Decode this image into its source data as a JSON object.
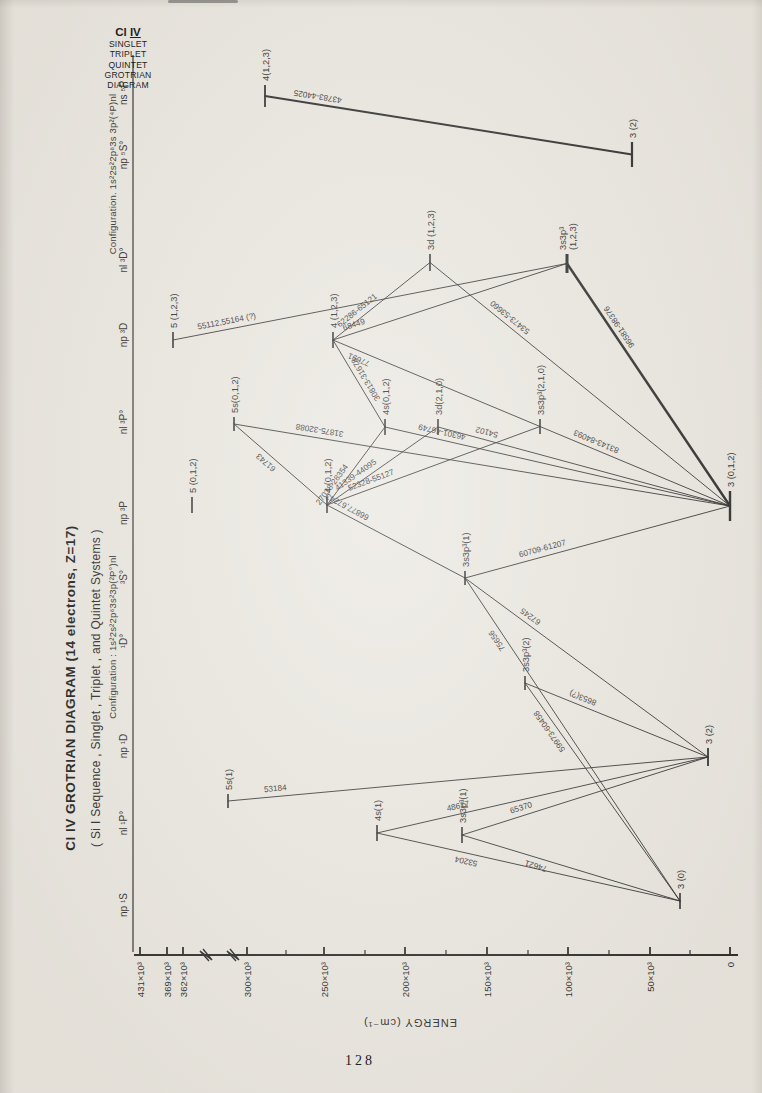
{
  "page": {
    "number": "128",
    "paper": "#ebe8e1",
    "ink": "#2b2b2b"
  },
  "corner_block": {
    "line1_prefix": "Cl ",
    "line1_numeral": "IV",
    "lines": [
      "SINGLET",
      "TRIPLET",
      "QUINTET",
      "GROTRIAN",
      "DIAGRAM"
    ]
  },
  "titles": {
    "main": "Cl IV  GROTRIAN  DIAGRAM  (14 electrons, Z=17)",
    "sub": "( Si I  Sequence ,  Singlet ,  Triplet ,  and  Quintet  Systems )"
  },
  "configurations": {
    "main": {
      "text": "Configuration : 1s²2s²2p⁶3s²3p(²P°)nl",
      "cx": 456,
      "y": 112
    },
    "quintet": {
      "text": "Configuration. 1s²2s²2p⁶3s 3p²(⁴P)nl",
      "cx": 919,
      "y": 112
    }
  },
  "axis": {
    "label": "ENERGY (cm⁻¹)",
    "label_x": 74,
    "label_y": 410,
    "x": 138,
    "y_top": 134,
    "y_bottom": 738,
    "ticks": [
      {
        "label": "431×10³",
        "y": 140
      },
      {
        "label": "369×10³",
        "y": 167
      },
      {
        "label": "362×10³",
        "y": 183
      },
      {
        "label": "300×10³",
        "y": 247
      },
      {
        "label": "250×10³",
        "y": 324
      },
      {
        "label": "200×10³",
        "y": 405
      },
      {
        "label": "150×10³",
        "y": 487
      },
      {
        "label": "100×10³",
        "y": 568
      },
      {
        "label": "50×10³",
        "y": 650
      },
      {
        "label": "0",
        "y": 730
      }
    ],
    "minor_ticks": [
      286,
      365,
      446,
      528,
      609,
      690
    ],
    "break_y": [
      203,
      230
    ]
  },
  "header_rule": {
    "y": 133,
    "x1": 141,
    "x2": 1038
  },
  "headers": [
    {
      "label": "np ¹S",
      "x": 188
    },
    {
      "label": "nl ¹P°",
      "x": 270
    },
    {
      "label": "np ¹D",
      "x": 347
    },
    {
      "label": "¹D°",
      "x": 452
    },
    {
      "label": "³S°",
      "x": 516
    },
    {
      "label": "np ³P",
      "x": 580
    },
    {
      "label": "nl ³P°",
      "x": 671
    },
    {
      "label": "np ³D",
      "x": 758
    },
    {
      "label": "nl ³D°",
      "x": 833
    },
    {
      "label": "np ⁵S°",
      "x": 938
    },
    {
      "label": "ns ⁵P",
      "x": 1000
    }
  ],
  "levels": [
    {
      "id": "s1",
      "label": "3 (0)",
      "x1": 184,
      "x2": 200,
      "y": 680,
      "lw": 1.6
    },
    {
      "id": "s2",
      "label": "5s(1)",
      "x1": 285,
      "x2": 299,
      "y": 228,
      "lw": 1.6
    },
    {
      "id": "s3",
      "label": "4s(1)",
      "x1": 252,
      "x2": 268,
      "y": 377,
      "lw": 1.6
    },
    {
      "id": "s4",
      "label": "3s3p³(1)",
      "x1": 250,
      "x2": 266,
      "y": 462,
      "lw": 1.6
    },
    {
      "id": "s5",
      "label": "3 (2)",
      "x1": 327,
      "x2": 345,
      "y": 708,
      "lw": 1.8
    },
    {
      "id": "s6",
      "label": "3s3p³(2)",
      "x1": 403,
      "x2": 417,
      "y": 525,
      "lw": 1.6
    },
    {
      "id": "s7",
      "label": "3s3p³(1)",
      "x1": 508,
      "x2": 522,
      "y": 465,
      "lw": 1.6
    },
    {
      "id": "t5p",
      "label": "5 (0,1,2)",
      "x1": 580,
      "x2": 596,
      "y": 192,
      "lw": 1.6
    },
    {
      "id": "t4p",
      "label": "4 (0,1,2)",
      "x1": 580,
      "x2": 596,
      "y": 327,
      "lw": 1.6
    },
    {
      "id": "g",
      "label": "3 (0,1,2)",
      "x1": 572,
      "x2": 602,
      "y": 730,
      "lw": 2.4
    },
    {
      "id": "t5s",
      "label": "5s(0,1,2)",
      "x1": 662,
      "x2": 676,
      "y": 234,
      "lw": 1.6
    },
    {
      "id": "t4s",
      "label": "4s(0,1,2)",
      "x1": 658,
      "x2": 674,
      "y": 385,
      "lw": 1.6
    },
    {
      "id": "t3d",
      "label": "3d(2,1,0)",
      "x1": 658,
      "x2": 674,
      "y": 438,
      "lw": 1.6
    },
    {
      "id": "t3p3P",
      "label": "3s3p³(2,1,0)",
      "x1": 659,
      "x2": 674,
      "y": 540,
      "lw": 1.6
    },
    {
      "id": "t5pD",
      "label": "5 (1,2,3)",
      "x1": 745,
      "x2": 761,
      "y": 173,
      "lw": 1.6
    },
    {
      "id": "t4pD",
      "label": "4 (1,2,3)",
      "x1": 745,
      "x2": 761,
      "y": 333,
      "lw": 1.6
    },
    {
      "id": "t3dD",
      "label": "3d (1,2,3)",
      "x1": 822,
      "x2": 839,
      "y": 430,
      "lw": 1.6
    },
    {
      "id": "t3p3D",
      "label": "3s3p³",
      "label2": "(1,2,3)",
      "x1": 820,
      "x2": 839,
      "y": 567,
      "lw": 3
    },
    {
      "id": "q3",
      "label": "3 (2)",
      "x1": 926,
      "x2": 951,
      "y": 632,
      "lw": 2.2
    },
    {
      "id": "q4",
      "label": "4(1,2,3)",
      "x1": 986,
      "x2": 1008,
      "y": 265,
      "lw": 1.8
    }
  ],
  "transitions": [
    {
      "from": "q4",
      "to": "q3",
      "label": "43783-44025",
      "t": 0.14,
      "side": 1,
      "w": 2.0
    },
    {
      "from": "t5pD",
      "to": "t3p3D",
      "label": "55112,55164 (?)",
      "t": 0.14,
      "side": 1,
      "w": 0.9
    },
    {
      "from": "t4pD",
      "to": "t3p3D",
      "label": "68449",
      "t": 0.1,
      "side": 1,
      "w": 0.9
    },
    {
      "from": "t4pD",
      "to": "t3dD",
      "label": "62286-65121",
      "t": 0.3,
      "side": 1,
      "w": 0.9
    },
    {
      "from": "t4pD",
      "to": "t3p3P",
      "label": "77691",
      "t": 0.14,
      "side": -1,
      "w": 0.9
    },
    {
      "from": "t4pD",
      "to": "t4s",
      "label": "30813-31678",
      "t": 0.5,
      "side": 1,
      "w": 0.9
    },
    {
      "from": "t5s",
      "to": "g",
      "label": "31875-32088",
      "t": 0.17,
      "side": 1,
      "w": 0.9
    },
    {
      "from": "t5s",
      "to": "t4p",
      "label": "61743",
      "t": 0.4,
      "side": -1,
      "w": 0.9
    },
    {
      "from": "t4p",
      "to": "t4s",
      "label": "27038-28354",
      "t": 0.2,
      "side": 1,
      "w": 0.9
    },
    {
      "from": "t4p",
      "to": "t3d",
      "label": "41339-44095",
      "t": 0.3,
      "side": 1,
      "w": 0.9
    },
    {
      "from": "t4p",
      "to": "t3p3P",
      "label": "52328-55127",
      "t": 0.22,
      "side": 1,
      "w": 0.9
    },
    {
      "from": "t4p",
      "to": "s7",
      "label": "66877,67243",
      "t": 0.12,
      "side": 1,
      "w": 0.9
    },
    {
      "from": "t3dD",
      "to": "g",
      "label": "53473-53660",
      "t": 0.25,
      "side": 1,
      "w": 0.9
    },
    {
      "from": "t3p3D",
      "to": "g",
      "label": "96581-98376",
      "t": 0.28,
      "side": 1,
      "w": 2.4
    },
    {
      "from": "t3p3P",
      "to": "g",
      "label": "83143-84093",
      "t": 0.28,
      "side": 1,
      "w": 0.9
    },
    {
      "from": "t3d",
      "to": "g",
      "label": "54102",
      "t": 0.16,
      "side": 1,
      "w": 0.9
    },
    {
      "from": "t4s",
      "to": "g",
      "label": "46301-46749",
      "t": 0.16,
      "side": 1,
      "w": 0.9
    },
    {
      "from": "s7",
      "to": "g",
      "label": "60709-61207",
      "t": 0.3,
      "side": 1,
      "w": 0.9
    },
    {
      "from": "s7",
      "to": "s5",
      "label": "67245",
      "t": 0.25,
      "side": 1,
      "w": 0.9
    },
    {
      "from": "s7",
      "to": "s1",
      "label": "75656",
      "t": 0.18,
      "side": -1,
      "w": 0.9
    },
    {
      "from": "s6",
      "to": "s5",
      "label": "8653(?)",
      "t": 0.3,
      "side": 1,
      "w": 0.9
    },
    {
      "from": "s6",
      "to": "s1",
      "label": "59973-60458",
      "t": 0.2,
      "side": -1,
      "w": 0.9
    },
    {
      "from": "s4",
      "to": "s5",
      "label": "65370",
      "t": 0.25,
      "side": 1,
      "w": 0.9
    },
    {
      "from": "s4",
      "to": "s1",
      "label": "74621",
      "t": 0.35,
      "side": -1,
      "w": 0.9
    },
    {
      "from": "s3",
      "to": "s5",
      "label": "48617",
      "t": 0.25,
      "side": 1,
      "w": 0.9
    },
    {
      "from": "s3",
      "to": "s1",
      "label": "53204",
      "t": 0.3,
      "side": -1,
      "w": 0.9
    },
    {
      "from": "s2",
      "to": "s5",
      "label": "53184",
      "t": 0.1,
      "side": 1,
      "w": 0.9
    }
  ]
}
